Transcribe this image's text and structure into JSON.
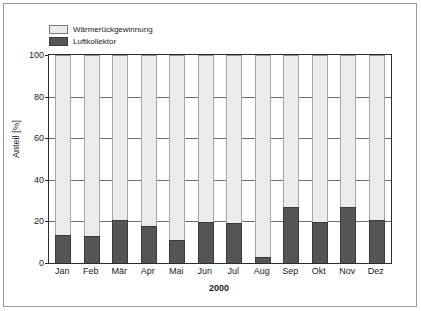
{
  "chart_data": {
    "type": "bar",
    "stacked": true,
    "title": "",
    "xlabel": "2000",
    "ylabel": "Anteil [%]",
    "ylim": [
      0,
      100
    ],
    "yticks": [
      0,
      20,
      40,
      60,
      80,
      100
    ],
    "ytick_labels": [
      "0",
      "20",
      "40",
      "60",
      "80",
      "100"
    ],
    "grid": "horizontal",
    "legend_position": "top-left",
    "categories": [
      "Jan",
      "Feb",
      "Mär",
      "Apr",
      "Mai",
      "Jun",
      "Jul",
      "Aug",
      "Sep",
      "Okt",
      "Nov",
      "Dez"
    ],
    "series": [
      {
        "name": "Luftkollektor",
        "color": "#555555",
        "values": [
          13.5,
          13,
          20.5,
          18,
          11,
          19.5,
          19,
          3,
          27,
          19.5,
          27,
          20.5
        ]
      },
      {
        "name": "Wärmerückgewinnung",
        "color": "#ebebeb",
        "values": [
          86.5,
          87,
          79.5,
          82,
          89,
          80.5,
          81,
          97,
          73,
          80.5,
          73,
          79.5
        ]
      }
    ]
  },
  "legend": {
    "items": [
      {
        "label": "Wärmerückgewinnung",
        "swatch": "light"
      },
      {
        "label": "Luftkollektor",
        "swatch": "dark"
      }
    ]
  },
  "axes": {
    "y_title": "Anteil [%]",
    "x_title": "2000",
    "y_ticks": [
      "100",
      "80",
      "60",
      "40",
      "20",
      "0"
    ],
    "x_ticks": [
      "Jan",
      "Feb",
      "Mär",
      "Apr",
      "Mai",
      "Jun",
      "Jul",
      "Aug",
      "Sep",
      "Okt",
      "Nov",
      "Dez"
    ]
  },
  "colors": {
    "dark_series": "#555555",
    "light_series": "#ebebeb",
    "axis": "#2b2b2b",
    "grid": "#6e6e6e",
    "frame": "#9a9a9a"
  }
}
